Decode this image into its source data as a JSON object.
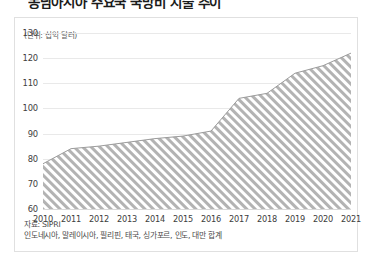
{
  "headline": {
    "text": "동남아시아 주요국 국방비 지출 추이"
  },
  "card": {
    "unit_label": "(단위: 십억 달러)",
    "source_label": "자료: SIPRI",
    "note_label": "인도네시아, 말레이시아, 필리핀, 태국, 싱가포르, 인도, 대만 합계"
  },
  "colors": {
    "area_hatch": "#b3b3b3",
    "area_fill": "#ffffff",
    "gridline": "#e9e9e9",
    "card_border": "#e0e0e0",
    "text": "#3d3d3d"
  },
  "chart_data": {
    "type": "area",
    "title": "동남아시아 주요국 국방비 지출 추이",
    "xlabel": "",
    "ylabel": "(단위: 십억 달러)",
    "x": [
      2010,
      2011,
      2012,
      2013,
      2014,
      2015,
      2016,
      2017,
      2018,
      2019,
      2020,
      2021
    ],
    "categories": [
      "2010",
      "2011",
      "2012",
      "2013",
      "2014",
      "2015",
      "2016",
      "2017",
      "2018",
      "2019",
      "2020",
      "2021"
    ],
    "values": [
      78,
      84,
      85,
      86.5,
      88,
      89,
      91,
      104,
      106,
      114,
      117,
      122
    ],
    "series": [
      {
        "name": "인도네시아, 말레이시아, 필리핀, 태국, 싱가포르, 인도, 대만 합계",
        "values": [
          78,
          84,
          85,
          86.5,
          88,
          89,
          91,
          104,
          106,
          114,
          117,
          122
        ]
      }
    ],
    "ylim": [
      60,
      130
    ],
    "yticks": [
      60,
      70,
      80,
      90,
      100,
      110,
      120,
      130
    ],
    "ytick_labels": [
      "60",
      "70",
      "80",
      "90",
      "100",
      "110",
      "120",
      "130"
    ],
    "xlim": [
      2010,
      2021
    ],
    "grid": true,
    "legend": false,
    "fill_pattern": "diagonal-hatch",
    "source": "자료: SIPRI",
    "note": "인도네시아, 말레이시아, 필리핀, 태국, 싱가포르, 인도, 대만 합계"
  }
}
